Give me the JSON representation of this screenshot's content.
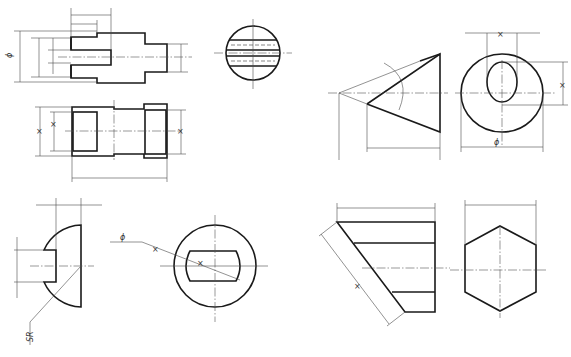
{
  "drawing": {
    "type": "engineering-dimensioning-exercise",
    "line_color": "#1a1a1a",
    "dim_color": "#4a4a4a",
    "views": [
      {
        "id": "stepped-shaft-front",
        "labels": {
          "diameter": "ϕ"
        }
      },
      {
        "id": "striped-circle-side",
        "labels": {}
      },
      {
        "id": "stepped-bushing-section",
        "labels": {
          "dim_a": "×",
          "dim_b": "×",
          "dim_c": "×"
        }
      },
      {
        "id": "truncated-cone-front",
        "labels": {}
      },
      {
        "id": "cone-end-view",
        "labels": {
          "top": "×",
          "right": "×",
          "diameter": "ϕ"
        }
      },
      {
        "id": "hemisphere-front",
        "labels": {
          "sphere_radius": "SR"
        }
      },
      {
        "id": "slotted-disc-end",
        "labels": {
          "diameter": "ϕ",
          "mark1": "×",
          "mark2": "×"
        }
      },
      {
        "id": "hex-prism-cut-front",
        "labels": {
          "slant": "×"
        }
      },
      {
        "id": "hexagon-end",
        "labels": {}
      }
    ]
  }
}
